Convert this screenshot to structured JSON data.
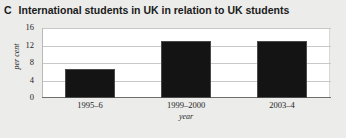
{
  "panel": {
    "letter": "C",
    "title": "International students in UK in relation to UK students"
  },
  "colors": {
    "bar": "#141414",
    "plot_background": "#ffffff",
    "figure_background": "#ececea",
    "gridline": "#c9c9c7",
    "axis": "#6e6e6c",
    "text": "#262626"
  },
  "chart_data": {
    "type": "bar",
    "title": "International students in UK in relation to UK students",
    "xlabel": "year",
    "ylabel": "per cent",
    "categories": [
      "1995–6",
      "1999–2000",
      "2003–4"
    ],
    "values": [
      6.6,
      13.0,
      13.0
    ],
    "ylim": [
      0,
      16
    ],
    "yticks": [
      0,
      4,
      8,
      12,
      16
    ],
    "ytick_labels": [
      "0",
      "4",
      "8",
      "12",
      "16"
    ],
    "grid": true,
    "legend": false
  }
}
